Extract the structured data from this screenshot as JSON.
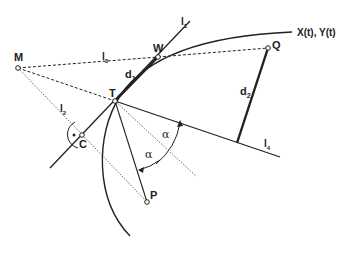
{
  "diagram": {
    "title": "",
    "curve_label": "X(t), Y(t)",
    "points": {
      "M": {
        "label": "M",
        "x": 18,
        "y": 68
      },
      "W": {
        "label": "W",
        "x": 158,
        "y": 57
      },
      "T": {
        "label": "T",
        "x": 115,
        "y": 101
      },
      "C": {
        "label": "C",
        "x": 82,
        "y": 135
      },
      "P": {
        "label": "P",
        "x": 147,
        "y": 202
      },
      "Q": {
        "label": "Q",
        "x": 268,
        "y": 48
      }
    },
    "lines": {
      "l1": {
        "label": "l",
        "sub": "1"
      },
      "l2": {
        "label": "l",
        "sub": "2"
      },
      "l3": {
        "label": "l",
        "sub": "3"
      },
      "l4": {
        "label": "l",
        "sub": "4"
      }
    },
    "distances": {
      "d1": {
        "label": "d",
        "sub": "1"
      },
      "d2": {
        "label": "d",
        "sub": "2"
      }
    },
    "angles": {
      "alpha1": "α",
      "alpha2": "α"
    },
    "right_angle_marker": "•"
  }
}
